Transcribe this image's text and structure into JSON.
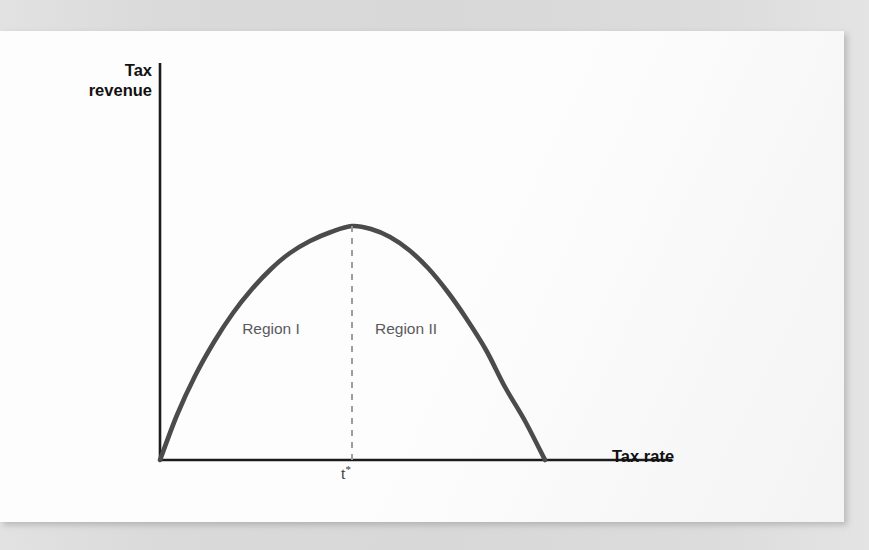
{
  "page": {
    "background_color": "#dcdcdc",
    "panel_color": "#fdfdfd",
    "bleed_through_lines": [
      "ideological reason for so much — since, in his view, the",
      "tax rate on the rich; with some of that revenue going",
      "a public good. But, in fact, more revenue also means",
      "that additional taxes can be spent on useful programs",
      "somewhat lower rates than before a recession begins",
      "the economy. A lower rate can finance public spending",
      "argue that the one tax rate is not optimal at all"
    ]
  },
  "chart_data": {
    "type": "line",
    "title": "",
    "xlabel": "Tax rate",
    "ylabel": "Tax revenue",
    "grid": false,
    "legend": null,
    "axis": {
      "origin_px": [
        160,
        460
      ],
      "y_axis_top_px": [
        160,
        63
      ],
      "x_axis_right_px": [
        672,
        460
      ],
      "x_ticks": [
        "t*"
      ],
      "y_ticks": []
    },
    "series": [
      {
        "name": "Laffer curve",
        "color": "#4b4b4d",
        "shape": "inverted-parabola",
        "x": [
          0.0,
          0.05,
          0.1,
          0.15,
          0.2,
          0.25,
          0.3,
          0.35,
          0.4,
          0.45,
          0.5,
          0.55,
          0.6,
          0.65,
          0.7,
          0.75,
          0.8,
          0.85,
          0.9,
          0.95,
          1.0
        ],
        "y": [
          0.0,
          0.19,
          0.36,
          0.51,
          0.64,
          0.75,
          0.84,
          0.91,
          0.96,
          0.99,
          1.0,
          0.99,
          0.96,
          0.91,
          0.84,
          0.75,
          0.64,
          0.51,
          0.36,
          0.19,
          0.0
        ],
        "points_px": [
          [
            160,
            460
          ],
          [
            177,
            415
          ],
          [
            195,
            376
          ],
          [
            214,
            342
          ],
          [
            233,
            313
          ],
          [
            252,
            289
          ],
          [
            271,
            269
          ],
          [
            290,
            253
          ],
          [
            310,
            241
          ],
          [
            331,
            232
          ],
          [
            352,
            226
          ],
          [
            371,
            229
          ],
          [
            390,
            237
          ],
          [
            409,
            250
          ],
          [
            428,
            268
          ],
          [
            447,
            291
          ],
          [
            466,
            318
          ],
          [
            486,
            350
          ],
          [
            505,
            387
          ],
          [
            525,
            421
          ],
          [
            545,
            460
          ]
        ]
      }
    ],
    "annotations": [
      {
        "name": "tstar-dashed-line",
        "label": "t*",
        "x_px": 352,
        "y_top_px": 226,
        "y_bottom_px": 460,
        "style": "dashed",
        "color": "#9a9a9a"
      },
      {
        "name": "region-1",
        "label": "Region I",
        "center_px": [
          271,
          332
        ],
        "color": "#5a5a5c"
      },
      {
        "name": "region-2",
        "label": "Region II",
        "center_px": [
          406,
          332
        ],
        "color": "#5a5a5c"
      }
    ]
  },
  "labels": {
    "y_axis_line1": "Tax",
    "y_axis_line2": "revenue",
    "x_axis": "Tax rate",
    "region_1": "Region I",
    "region_2": "Region II",
    "tstar_base": "t",
    "tstar_superscript": "*"
  }
}
